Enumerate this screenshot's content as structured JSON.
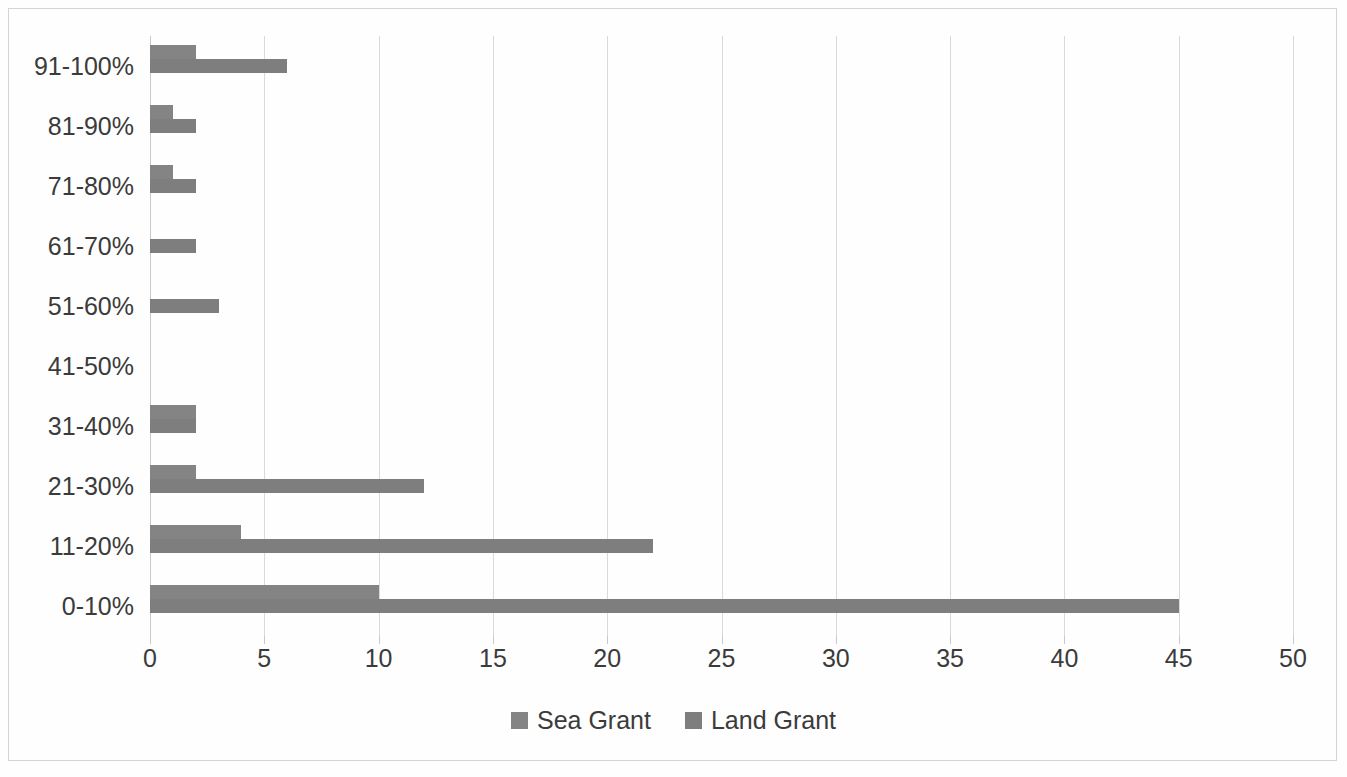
{
  "chart_data": {
    "type": "bar",
    "orientation": "horizontal",
    "title": "",
    "xlabel": "",
    "ylabel": "",
    "xlim": [
      0,
      50
    ],
    "xticks": [
      0,
      5,
      10,
      15,
      20,
      25,
      30,
      35,
      40,
      45,
      50
    ],
    "xtick_labels": [
      "0",
      "5",
      "10",
      "15",
      "20",
      "25",
      "30",
      "35",
      "40",
      "45",
      "50"
    ],
    "grid": true,
    "grid_axis": "x",
    "legend_position": "bottom",
    "categories": [
      "91-100%",
      "81-90%",
      "71-80%",
      "61-70%",
      "51-60%",
      "41-50%",
      "31-40%",
      "21-30%",
      "11-20%",
      "0-10%"
    ],
    "series": [
      {
        "name": "Sea Grant",
        "color": "#848484",
        "values": [
          2,
          1,
          1,
          0,
          0,
          0,
          2,
          2,
          4,
          10
        ]
      },
      {
        "name": "Land Grant",
        "color": "#7e7e7e",
        "values": [
          6,
          2,
          2,
          2,
          3,
          0,
          2,
          12,
          22,
          45
        ]
      }
    ]
  },
  "legend": {
    "items": [
      {
        "label": "Sea Grant",
        "color": "#848484"
      },
      {
        "label": "Land Grant",
        "color": "#7e7e7e"
      }
    ]
  },
  "style": {
    "gridline_color": "#d9d9d9",
    "axis_color": "#c9c9c9",
    "border_color": "#d4d4d4",
    "text_color": "#3b3b3b",
    "background": "#fefefe"
  }
}
